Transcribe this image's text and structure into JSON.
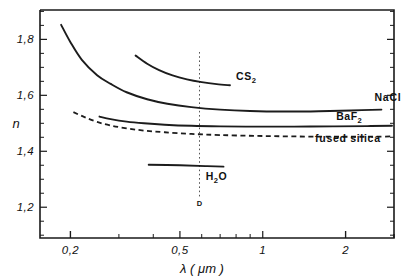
{
  "figure": {
    "kind": "refractive-index-dispersion-plot"
  },
  "chart_data": {
    "type": "line",
    "title": "",
    "xlabel": "λ ( μm )",
    "ylabel": "n",
    "xscale": "log",
    "yscale": "linear",
    "xlim": [
      0.155,
      3.0
    ],
    "ylim": [
      1.09,
      1.905
    ],
    "xticks": [
      0.2,
      0.5,
      1,
      2
    ],
    "xtick_labels": [
      "0,2",
      "0,5",
      "1",
      "2"
    ],
    "yticks": [
      1.2,
      1.4,
      1.6,
      1.8
    ],
    "ytick_labels": [
      "1,2",
      "1,4",
      "1,6",
      "1,8"
    ],
    "grid": false,
    "legend": "inline-curve-labels",
    "annotations": [
      {
        "name": "sodium-d-line",
        "label": "D",
        "x": 0.589,
        "style": "dotted-vertical",
        "label_y": 1.205
      }
    ],
    "series": [
      {
        "name": "NaCl",
        "label": "NaCl",
        "style": "solid",
        "label_x": 2.55,
        "label_y": 1.578,
        "points": [
          [
            0.185,
            1.852
          ],
          [
            0.2,
            1.79
          ],
          [
            0.22,
            1.727
          ],
          [
            0.25,
            1.672
          ],
          [
            0.28,
            1.641
          ],
          [
            0.32,
            1.611
          ],
          [
            0.38,
            1.586
          ],
          [
            0.45,
            1.57
          ],
          [
            0.55,
            1.558
          ],
          [
            0.7,
            1.549
          ],
          [
            0.9,
            1.544
          ],
          [
            1.2,
            1.542
          ],
          [
            1.6,
            1.543
          ],
          [
            2.1,
            1.546
          ],
          [
            2.7,
            1.549
          ]
        ]
      },
      {
        "name": "CS2",
        "label": "CS",
        "label_sub": "2",
        "style": "solid",
        "label_x": 0.8,
        "label_y": 1.655,
        "points": [
          [
            0.345,
            1.742
          ],
          [
            0.38,
            1.713
          ],
          [
            0.42,
            1.69
          ],
          [
            0.47,
            1.671
          ],
          [
            0.53,
            1.657
          ],
          [
            0.6,
            1.647
          ],
          [
            0.68,
            1.64
          ],
          [
            0.76,
            1.636
          ]
        ]
      },
      {
        "name": "BaF2",
        "label": "BaF",
        "label_sub": "2",
        "style": "solid",
        "label_x": 1.85,
        "label_y": 1.513,
        "points": [
          [
            0.255,
            1.524
          ],
          [
            0.28,
            1.515
          ],
          [
            0.32,
            1.506
          ],
          [
            0.37,
            1.5
          ],
          [
            0.44,
            1.495
          ],
          [
            0.55,
            1.491
          ],
          [
            0.7,
            1.489
          ],
          [
            0.95,
            1.488
          ],
          [
            1.3,
            1.488
          ],
          [
            1.8,
            1.489
          ],
          [
            2.4,
            1.49
          ],
          [
            2.95,
            1.491
          ]
        ]
      },
      {
        "name": "fused silica",
        "label": "fused  silica",
        "style": "dashed",
        "label_x": 1.55,
        "label_y": 1.432,
        "points": [
          [
            0.205,
            1.54
          ],
          [
            0.225,
            1.522
          ],
          [
            0.25,
            1.505
          ],
          [
            0.28,
            1.492
          ],
          [
            0.32,
            1.482
          ],
          [
            0.37,
            1.474
          ],
          [
            0.44,
            1.468
          ],
          [
            0.55,
            1.462
          ],
          [
            0.7,
            1.458
          ],
          [
            0.95,
            1.455
          ],
          [
            1.3,
            1.453
          ],
          [
            1.8,
            1.452
          ],
          [
            2.4,
            1.452
          ],
          [
            2.95,
            1.453
          ]
        ]
      },
      {
        "name": "H2O",
        "label": "H",
        "label_sub": "2",
        "label_tail": "O",
        "style": "solid",
        "label_x": 0.62,
        "label_y": 1.297,
        "points": [
          [
            0.385,
            1.352
          ],
          [
            0.5,
            1.35
          ],
          [
            0.62,
            1.347
          ],
          [
            0.72,
            1.345
          ]
        ]
      }
    ]
  }
}
